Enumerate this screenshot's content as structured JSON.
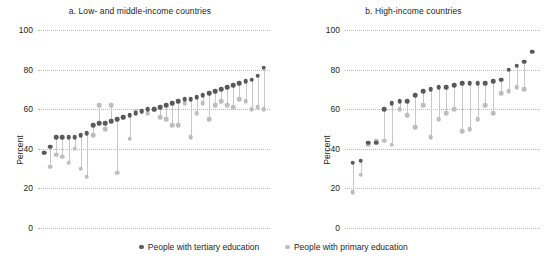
{
  "figure": {
    "ylabel": "Percent",
    "yticks": [
      0,
      20,
      40,
      60,
      80,
      100
    ],
    "ylim": [
      0,
      100
    ]
  },
  "legend": {
    "position": "bottom-center",
    "items": [
      {
        "label": "People with tertiary education",
        "color": "#595959",
        "key": "tertiary"
      },
      {
        "label": "People with primary education",
        "color": "#bdbdbd",
        "key": "primary"
      }
    ]
  },
  "panels": [
    {
      "id": "a",
      "title": "a. Low- and middle-income countries"
    },
    {
      "id": "b",
      "title": "b. High-income countries"
    }
  ],
  "chart_data": [
    {
      "type": "scatter",
      "title": "a. Low- and middle-income countries",
      "xlabel": "",
      "ylabel": "Percent",
      "ylim": [
        0,
        100
      ],
      "yticks": [
        0,
        20,
        40,
        60,
        80,
        100
      ],
      "grid": "horizontal-dotted",
      "x": [
        1,
        2,
        3,
        4,
        5,
        6,
        7,
        8,
        9,
        10,
        11,
        12,
        13,
        14,
        15,
        16,
        17,
        18,
        19,
        20,
        21,
        22,
        23,
        24,
        25,
        26,
        27,
        28,
        29,
        30,
        31,
        32,
        33,
        34,
        35,
        36,
        37
      ],
      "series": [
        {
          "name": "People with tertiary education",
          "color": "#595959",
          "values": [
            38,
            41,
            46,
            46,
            46,
            46,
            47,
            48,
            52,
            53,
            53,
            54,
            55,
            56,
            57,
            58,
            59,
            60,
            60,
            61,
            62,
            63,
            64,
            65,
            65,
            66,
            67,
            68,
            69,
            70,
            71,
            72,
            73,
            74,
            75,
            77,
            81
          ]
        },
        {
          "name": "People with primary education",
          "color": "#bdbdbd",
          "values": [
            38,
            31,
            37,
            36,
            33,
            40,
            30,
            26,
            47,
            62,
            50,
            62,
            28,
            56,
            45,
            59,
            59,
            58,
            60,
            56,
            55,
            52,
            52,
            63,
            46,
            58,
            63,
            55,
            62,
            64,
            62,
            61,
            65,
            64,
            60,
            61,
            60
          ]
        }
      ]
    },
    {
      "type": "scatter",
      "title": "b. High-income countries",
      "xlabel": "",
      "ylabel": "Percent",
      "ylim": [
        0,
        100
      ],
      "yticks": [
        0,
        20,
        40,
        60,
        80,
        100
      ],
      "grid": "horizontal-dotted",
      "x": [
        1,
        2,
        3,
        4,
        5,
        6,
        7,
        8,
        9,
        10,
        11,
        12,
        13,
        14,
        15,
        16,
        17,
        18,
        19,
        20,
        21,
        22,
        23,
        24,
        25,
        26,
        27,
        28,
        29,
        30
      ],
      "series": [
        {
          "name": "People with tertiary education",
          "color": "#595959",
          "values": [
            33,
            34,
            43,
            43,
            60,
            63,
            64,
            64,
            67,
            69,
            70,
            71,
            71,
            72,
            73,
            73,
            73,
            73,
            74,
            75,
            80,
            82,
            84,
            89,
            null,
            null,
            null,
            null,
            null,
            null
          ]
        },
        {
          "name": "People with primary education",
          "color": "#bdbdbd",
          "values": [
            18,
            27,
            42,
            44,
            44,
            42,
            60,
            57,
            51,
            62,
            46,
            55,
            58,
            60,
            49,
            50,
            55,
            62,
            58,
            68,
            69,
            71,
            70,
            null,
            null,
            null,
            null,
            null,
            null,
            null
          ]
        }
      ]
    }
  ]
}
